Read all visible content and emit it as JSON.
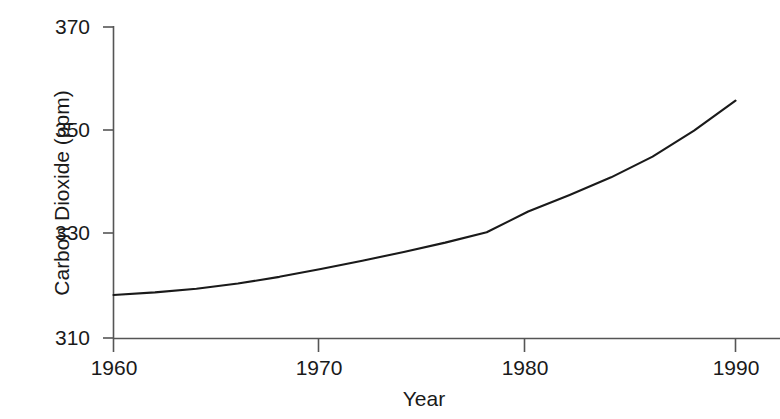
{
  "chart_data": {
    "type": "line",
    "title": "",
    "subtitle": "",
    "xlabel": "Year",
    "ylabel": "Carbon Dioxide (ppm)",
    "xlim": [
      1960,
      1990
    ],
    "ylim": [
      310,
      370
    ],
    "xticks": [
      1960,
      1970,
      1980,
      1990
    ],
    "yticks": [
      310,
      330,
      350,
      370
    ],
    "xtick_labels": [
      "1960",
      "1970",
      "1980",
      "1990"
    ],
    "ytick_labels": [
      "310",
      "330",
      "350",
      "370"
    ],
    "grid": false,
    "legend": null,
    "annotations": [],
    "series": [
      {
        "name": "Carbon Dioxide",
        "color": "#1a1a1a",
        "x": [
          1960,
          1962,
          1964,
          1966,
          1968,
          1970,
          1972,
          1974,
          1976,
          1978,
          1980,
          1982,
          1984,
          1986,
          1988,
          1990
        ],
        "values": [
          318.3,
          318.8,
          319.5,
          320.5,
          321.8,
          323.3,
          324.9,
          326.6,
          328.4,
          330.4,
          334.4,
          337.6,
          341.0,
          345.0,
          350.0,
          355.8
        ]
      }
    ]
  },
  "axis": {
    "y_title": "Carbon Dioxide (ppm)",
    "x_title": "Year",
    "y_labels": [
      "370",
      "350",
      "330",
      "310"
    ],
    "x_labels": [
      "1960",
      "1970",
      "1980",
      "1990"
    ]
  },
  "colors": {
    "line": "#1a1a1a",
    "axis": "#555555",
    "background": "#ffffff",
    "text": "#1a1a1a"
  }
}
